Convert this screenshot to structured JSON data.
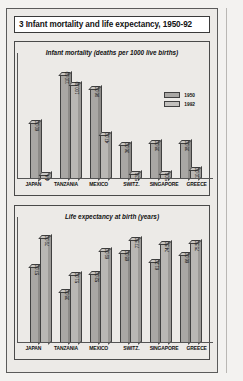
{
  "figure": {
    "title": "3 Infant mortality and life expectancy, 1950-92"
  },
  "legend": {
    "items": [
      {
        "label": "1950",
        "color": "#a9a7a4"
      },
      {
        "label": "1992",
        "color": "#c2c0bd"
      }
    ]
  },
  "chart_data": [
    {
      "type": "bar",
      "title": "Infant mortality (deaths per 1000 live births)",
      "xlabel": "",
      "ylabel": "",
      "ylim": [
        0,
        120
      ],
      "grid": false,
      "legend_position": "top-right",
      "categories": [
        "JAPAN",
        "TANZANIA",
        "MEXICO",
        "SWITZ.",
        "SINGAPORE",
        "GREECE"
      ],
      "series": [
        {
          "name": "1950",
          "values": [
            60.0,
            110.0,
            96.0,
            36.0,
            38.0,
            38.0
          ],
          "labels": [
            "60.00",
            "110.00",
            "96.00",
            "36.00",
            "38.00",
            "38.00"
          ]
        },
        {
          "name": "1992",
          "values": [
            4.4,
            100.0,
            47.0,
            5.3,
            5.0,
            10.0
          ],
          "labels": [
            "4.4",
            "100.00",
            "47.00",
            "5.30",
            "5.00",
            "10.00"
          ]
        }
      ]
    },
    {
      "type": "bar",
      "title": "Life expectancy at birth (years)",
      "xlabel": "",
      "ylabel": "",
      "ylim": [
        0,
        85
      ],
      "grid": false,
      "legend_position": "none",
      "categories": [
        "JAPAN",
        "TANZANIA",
        "MEXICO",
        "SWITZ.",
        "SINGAPORE",
        "GREECE"
      ],
      "series": [
        {
          "name": "1950",
          "values": [
            57.0,
            38.0,
            52.0,
            68.0,
            61.2,
            66.0
          ],
          "labels": [
            "57.00",
            "38.00",
            "52.00",
            "68.00",
            "61.20",
            "66.00"
          ]
        },
        {
          "name": "1992",
          "values": [
            79.0,
            51.0,
            69.0,
            77.5,
            74.5,
            75.5
          ],
          "labels": [
            "79.00",
            "51.00",
            "69.00",
            "77.50",
            "74.50",
            "75.50"
          ]
        }
      ]
    }
  ]
}
